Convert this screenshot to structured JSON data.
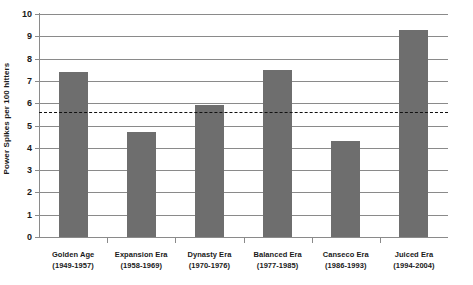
{
  "chart_data": {
    "type": "bar",
    "title": "",
    "subtitle": "",
    "xlabel": "",
    "ylabel": "Power Spikes per 100 hitters",
    "ylim": [
      0,
      10
    ],
    "y_ticks": [
      "0",
      "1",
      "2",
      "3",
      "4",
      "5",
      "6",
      "7",
      "8",
      "9",
      "10"
    ],
    "grid": true,
    "legend": "none",
    "bar_color": "#6e6e6e",
    "axis_color": "#8a8a8a",
    "categories": [
      "Golden Age",
      "Expansion Era",
      "Dynasty Era",
      "Balanced Era",
      "Canseco Era",
      "Juiced Era"
    ],
    "category_years": [
      "(1949-1957)",
      "(1958-1969)",
      "(1970-1976)",
      "(1977-1985)",
      "(1986-1993)",
      "(1994-2004)"
    ],
    "values": [
      7.4,
      4.7,
      5.9,
      7.5,
      4.3,
      9.3
    ],
    "reference_line": {
      "value": 5.6,
      "style": "dashed",
      "color": "#111111",
      "label": ""
    }
  }
}
